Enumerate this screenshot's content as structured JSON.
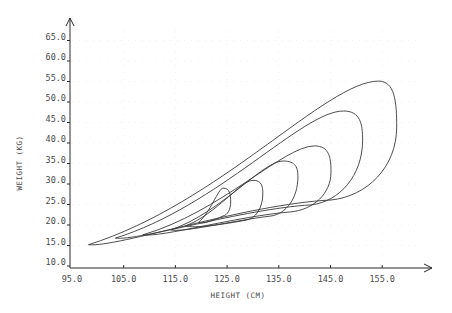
{
  "chart_data": {
    "type": "line",
    "title": "",
    "xlabel": "HEIGHT (CM)",
    "ylabel": "WEIGHT (KG)",
    "xlim": [
      95.0,
      164.0
    ],
    "ylim": [
      10.0,
      67.0
    ],
    "x_ticks": [
      "95.0",
      "105.0",
      "115.0",
      "125.0",
      "135.0",
      "145.0",
      "155.0"
    ],
    "y_ticks": [
      "10.0",
      "15.0",
      "20.0",
      "25.0",
      "30.0",
      "35.0",
      "40.0",
      "45.0",
      "50.0",
      "55.0",
      "60.0",
      "65.0"
    ],
    "grid": "faint dotted",
    "legend": "none",
    "series": [
      {
        "name": "contour-1",
        "left_tip": [
          98.2,
          15.2
        ],
        "top": [
          154.3,
          55.1
        ],
        "right": [
          157.8,
          43.9
        ],
        "bottom": [
          145.1,
          26.1
        ]
      },
      {
        "name": "contour-2",
        "left_tip": [
          103.4,
          16.8
        ],
        "top": [
          147.5,
          47.8
        ],
        "right": [
          151.2,
          40.7
        ],
        "bottom": [
          141.2,
          24.9
        ]
      },
      {
        "name": "contour-3",
        "left_tip": [
          108.7,
          17.6
        ],
        "top": [
          141.9,
          39.3
        ],
        "right": [
          145.1,
          32.9
        ],
        "bottom": [
          137.3,
          23.2
        ]
      },
      {
        "name": "contour-4",
        "left_tip": [
          114.1,
          18.8
        ],
        "top": [
          135.8,
          35.6
        ],
        "right": [
          138.7,
          31.7
        ],
        "bottom": [
          133.5,
          22.2
        ]
      },
      {
        "name": "contour-5",
        "left_tip": [
          117.0,
          19.8
        ],
        "top": [
          130.0,
          30.9
        ],
        "right": [
          131.9,
          27.6
        ],
        "bottom": [
          128.7,
          21.2
        ]
      },
      {
        "name": "contour-6",
        "left_tip": [
          119.5,
          20.7
        ],
        "top": [
          124.2,
          29.0
        ],
        "right": [
          125.7,
          25.6
        ],
        "bottom": [
          124.2,
          22.2
        ]
      }
    ]
  },
  "axes": {
    "x_label": "HEIGHT (CM)",
    "y_label": "WEIGHT (KG)"
  }
}
